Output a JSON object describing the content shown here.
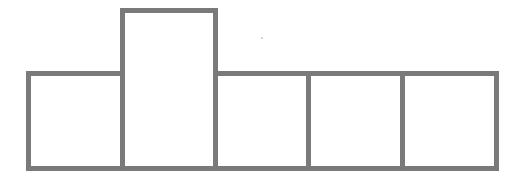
{
  "diagram": {
    "stroke_color": "#7a7a7a",
    "stroke_width": 5,
    "cells": [
      {
        "id": "cell-1",
        "x": 26,
        "y": 71,
        "w": 99,
        "h": 100
      },
      {
        "id": "cell-2-tall",
        "x": 120,
        "y": 8,
        "w": 98,
        "h": 163
      },
      {
        "id": "cell-3",
        "x": 213,
        "y": 71,
        "w": 98,
        "h": 100
      },
      {
        "id": "cell-4",
        "x": 306,
        "y": 71,
        "w": 99,
        "h": 100
      },
      {
        "id": "cell-5",
        "x": 400,
        "y": 71,
        "w": 99,
        "h": 100
      }
    ]
  }
}
